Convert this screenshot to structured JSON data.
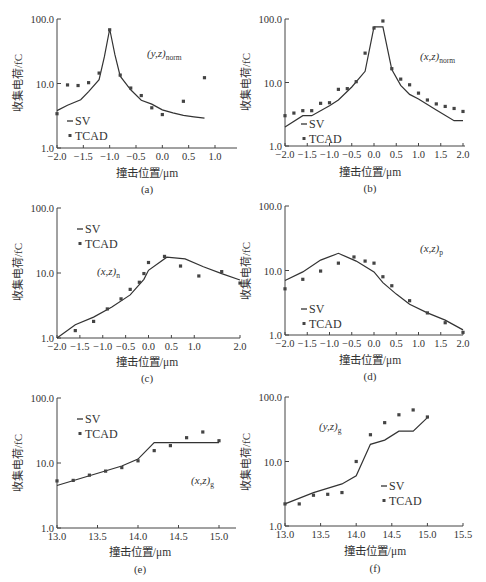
{
  "figure": {
    "ylabel": "收集电荷/fC",
    "xlabel": "撞击位置/μm",
    "legend": {
      "sv": "SV",
      "tcad": "TCAD"
    },
    "colors": {
      "line": "#333333",
      "marker": "#444444",
      "axis": "#444444",
      "background": "#ffffff"
    }
  },
  "chart_data": [
    {
      "id": "a",
      "caption": "(a)",
      "type": "line",
      "annotation": {
        "main": "(y,z)",
        "sub": "norm"
      },
      "xlabel": "撞击位置/μm",
      "ylabel": "收集电荷/fC",
      "yscale": "log",
      "xlim": [
        -2.0,
        1.4
      ],
      "ylim": [
        1.0,
        100.0
      ],
      "xticks": [
        "-2.0",
        "-1.5",
        "-1.0",
        "-0.5",
        "0.0",
        "0.5",
        "1.0"
      ],
      "yticks": [
        "1.0",
        "10.0",
        "100.0"
      ],
      "legend_position": "lower left",
      "series": [
        {
          "name": "SV",
          "kind": "line",
          "x": [
            -2.0,
            -1.8,
            -1.55,
            -1.4,
            -1.2,
            -1.1,
            -1.0,
            -0.9,
            -0.8,
            -0.6,
            -0.4,
            -0.2,
            0.0,
            0.2,
            0.4,
            0.6,
            0.8
          ],
          "y": [
            3.8,
            4.6,
            5.6,
            7.5,
            11.5,
            26,
            70,
            28,
            13,
            8.0,
            5.5,
            4.8,
            3.9,
            3.5,
            3.2,
            3.05,
            2.9
          ]
        },
        {
          "name": "TCAD",
          "kind": "scatter",
          "x": [
            -2.0,
            -1.8,
            -1.6,
            -1.4,
            -1.2,
            -1.0,
            -0.8,
            -0.6,
            -0.4,
            -0.2,
            0.0,
            0.4,
            0.8
          ],
          "y": [
            3.4,
            9.5,
            9.3,
            10.3,
            14.5,
            68,
            13.5,
            8.5,
            6.5,
            4.2,
            3.3,
            5.3,
            12.3
          ]
        }
      ]
    },
    {
      "id": "b",
      "caption": "(b)",
      "type": "line",
      "annotation": {
        "main": "(x,z)",
        "sub": "norm"
      },
      "xlabel": "撞击位置/μm",
      "ylabel": "收集电荷/fC",
      "yscale": "log",
      "xlim": [
        -2.0,
        2.0
      ],
      "ylim": [
        1.0,
        100.0
      ],
      "xticks": [
        "-2.0",
        "-1.5",
        "-1.0",
        "-0.5",
        "0.0",
        "0.5",
        "1.0",
        "1.5",
        "2.0"
      ],
      "yticks": [
        "1.0",
        "10.0",
        "100.0"
      ],
      "legend_position": "lower left",
      "series": [
        {
          "name": "SV",
          "kind": "line",
          "x": [
            -2.0,
            -1.6,
            -1.4,
            -1.0,
            -0.8,
            -0.5,
            -0.2,
            0.0,
            0.2,
            0.4,
            0.6,
            0.8,
            1.0,
            1.4,
            1.8,
            2.0
          ],
          "y": [
            2.0,
            3.0,
            3.0,
            4.3,
            5.3,
            8.5,
            15,
            75,
            75,
            16,
            9.0,
            6.5,
            5.5,
            3.7,
            2.5,
            2.5
          ]
        },
        {
          "name": "TCAD",
          "kind": "scatter",
          "x": [
            -2.0,
            -1.8,
            -1.6,
            -1.4,
            -1.2,
            -1.0,
            -0.8,
            -0.6,
            -0.4,
            -0.2,
            0.0,
            0.2,
            0.4,
            0.6,
            0.8,
            1.0,
            1.2,
            1.4,
            1.6,
            1.8,
            2.0
          ],
          "y": [
            3.0,
            3.3,
            3.6,
            3.6,
            4.7,
            4.8,
            7.8,
            8.0,
            10.3,
            29,
            72,
            93,
            16.5,
            11.3,
            9.2,
            6.8,
            5.3,
            4.6,
            4.2,
            3.9,
            3.5
          ]
        }
      ]
    },
    {
      "id": "c",
      "caption": "(c)",
      "type": "line",
      "annotation": {
        "main": "(x,z)",
        "sub": "n"
      },
      "xlabel": "撞击位置/μm",
      "ylabel": "收集电荷/fC",
      "yscale": "log",
      "xlim": [
        -2.0,
        2.0
      ],
      "ylim": [
        1.0,
        100.0
      ],
      "xticks": [
        "-2.0",
        "-1.5",
        "-1.0",
        "-0.5",
        "0.0",
        "0.5",
        "1.0",
        "2.0"
      ],
      "yticks": [
        "1.0",
        "10.0",
        "100.0"
      ],
      "legend_position": "upper left",
      "series": [
        {
          "name": "SV",
          "kind": "line",
          "x": [
            -2.0,
            -1.6,
            -1.2,
            -0.8,
            -0.4,
            -0.1,
            0.0,
            0.4,
            0.8,
            1.2,
            1.6,
            2.0
          ],
          "y": [
            1.0,
            1.6,
            2.1,
            3.0,
            4.6,
            8.0,
            11.0,
            17.5,
            16.5,
            12.5,
            9.8,
            7.8
          ]
        },
        {
          "name": "TCAD",
          "kind": "scatter",
          "x": [
            -1.6,
            -1.2,
            -0.9,
            -0.6,
            -0.4,
            -0.2,
            -0.1,
            0.0,
            0.35,
            0.7,
            1.1,
            1.6,
            2.0
          ],
          "y": [
            1.3,
            1.8,
            2.8,
            4.0,
            5.6,
            7.2,
            9.8,
            14.5,
            18,
            12.8,
            9.0,
            10.5,
            7.0
          ]
        }
      ]
    },
    {
      "id": "d",
      "caption": "(d)",
      "type": "line",
      "annotation": {
        "main": "(x,z)",
        "sub": "p"
      },
      "xlabel": "撞击位置/μm",
      "ylabel": "收集电荷/fC",
      "yscale": "log",
      "xlim": [
        -2.0,
        2.0
      ],
      "ylim": [
        1.0,
        100.0
      ],
      "xticks": [
        "-2.0",
        "-1.5",
        "-1.0",
        "-0.5",
        "0.0",
        "0.5",
        "1.0",
        "1.5",
        "2.0"
      ],
      "yticks": [
        "1.0",
        "10.0",
        "100.0"
      ],
      "legend_position": "lower left",
      "series": [
        {
          "name": "SV",
          "kind": "line",
          "x": [
            -2.0,
            -1.6,
            -1.2,
            -0.8,
            -0.4,
            0.0,
            0.2,
            0.5,
            0.8,
            1.2,
            1.6,
            2.0
          ],
          "y": [
            7.0,
            9.5,
            14.5,
            18.5,
            14.0,
            9.5,
            6.5,
            4.3,
            3.0,
            2.2,
            1.7,
            1.2
          ]
        },
        {
          "name": "TCAD",
          "kind": "scatter",
          "x": [
            -2.0,
            -1.6,
            -1.2,
            -0.8,
            -0.45,
            -0.2,
            0.0,
            0.2,
            0.4,
            0.8,
            1.2,
            1.6,
            2.0
          ],
          "y": [
            5.2,
            7.3,
            9.8,
            13.0,
            16.2,
            14.0,
            13.0,
            8.0,
            5.8,
            3.4,
            2.2,
            1.55,
            1.1
          ]
        }
      ]
    },
    {
      "id": "e",
      "caption": "(e)",
      "type": "line",
      "annotation": {
        "main": "(x,z)",
        "sub": "g"
      },
      "xlabel": "撞击位置/μm",
      "ylabel": "收集电荷/fC",
      "yscale": "log",
      "xlim": [
        13.0,
        15.2
      ],
      "ylim": [
        1.0,
        100.0
      ],
      "xticks": [
        "13.0",
        "13.5",
        "14.0",
        "14.5",
        "15.0"
      ],
      "yticks": [
        "1.0",
        "10.0",
        "100.0"
      ],
      "legend_position": "upper left",
      "series": [
        {
          "name": "SV",
          "kind": "line",
          "x": [
            13.0,
            13.8,
            14.0,
            14.2,
            14.6,
            15.0
          ],
          "y": [
            4.5,
            9.0,
            11.5,
            20.5,
            20.5,
            20.5
          ]
        },
        {
          "name": "TCAD",
          "kind": "scatter",
          "x": [
            13.0,
            13.2,
            13.4,
            13.6,
            13.8,
            14.0,
            14.2,
            14.4,
            14.6,
            14.8,
            15.0
          ],
          "y": [
            5.3,
            5.4,
            6.5,
            7.5,
            8.5,
            10.8,
            15.5,
            18.5,
            24.5,
            30,
            22
          ]
        }
      ]
    },
    {
      "id": "f",
      "caption": "(f)",
      "type": "line",
      "annotation": {
        "main": "(y,z)",
        "sub": "g"
      },
      "xlabel": "撞击位置/μm",
      "ylabel": "收集电荷/fC",
      "yscale": "log",
      "xlim": [
        13.0,
        15.5
      ],
      "ylim": [
        1.0,
        100.0
      ],
      "xticks": [
        "13.0",
        "13.5",
        "14.0",
        "14.5",
        "15.0",
        "15.5"
      ],
      "yticks": [
        "1.0",
        "10.0",
        "100.0"
      ],
      "legend_position": "lower right",
      "series": [
        {
          "name": "SV",
          "kind": "line",
          "x": [
            13.0,
            13.4,
            13.8,
            14.0,
            14.2,
            14.4,
            14.6,
            14.8,
            15.0
          ],
          "y": [
            2.2,
            3.3,
            4.5,
            6.0,
            18.5,
            21.5,
            29.5,
            29.5,
            48
          ]
        },
        {
          "name": "TCAD",
          "kind": "scatter",
          "x": [
            13.0,
            13.2,
            13.4,
            13.6,
            13.8,
            14.0,
            14.2,
            14.4,
            14.6,
            14.8,
            15.0
          ],
          "y": [
            2.2,
            2.2,
            3.0,
            3.1,
            3.3,
            10.0,
            26,
            40,
            53,
            63,
            49
          ]
        }
      ]
    }
  ]
}
